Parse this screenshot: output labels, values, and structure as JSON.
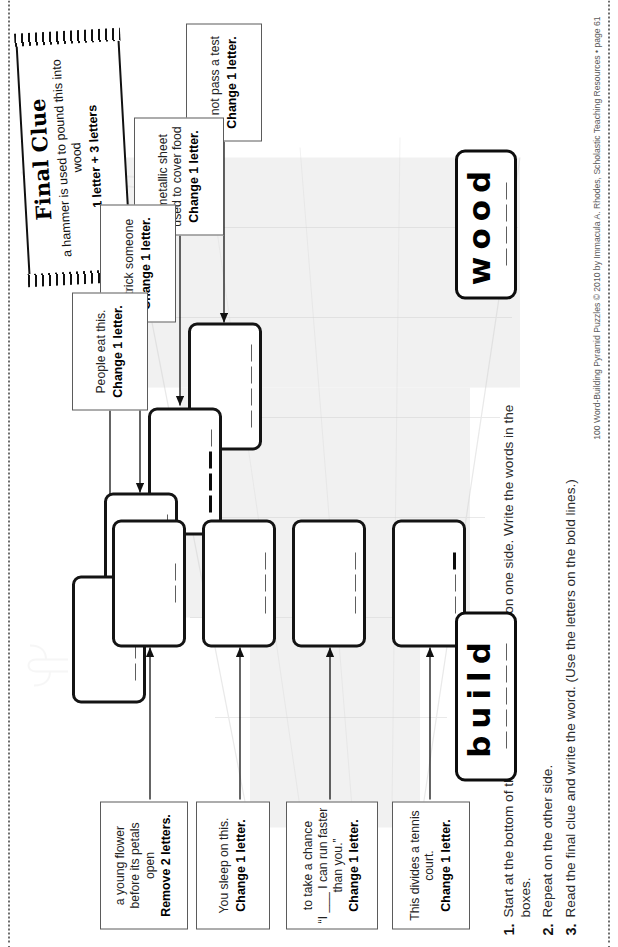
{
  "page": {
    "orientation_note": "worksheet rotated 90 degrees",
    "footer": "100 Word-Building Pyramid Puzzles © 2010 by Immacula A. Rhodes, Scholastic Teaching Resources • page 61"
  },
  "final_clue": {
    "title": "Final Clue",
    "line1": "a hammer is used to pound this into wood",
    "line2": "1 letter + 3 letters"
  },
  "instructions": [
    {
      "num": "1.",
      "text": "Start at the bottom of the pyramid. Read the clues on one side. Write the words in the boxes."
    },
    {
      "num": "2.",
      "text": "Repeat on the other side."
    },
    {
      "num": "3.",
      "text": "Read the final clue and write the word. (Use the letters on the bold lines.)"
    }
  ],
  "clues_top": [
    {
      "text": "to not pass a test",
      "bold": "Change 1 letter."
    },
    {
      "text": "a metallic sheet used to cover food",
      "bold": "Change 1 letter."
    },
    {
      "text": "to trick someone",
      "bold": "Change 1 letter."
    },
    {
      "text": "People eat this.",
      "bold": "Change 1 letter."
    }
  ],
  "clues_bottom": [
    {
      "text": "This divides a tennis court.",
      "bold": "Change 1 letter."
    },
    {
      "text": "to take a chance\n“I ___ I can run faster than you.”",
      "bold": "Change 1 letter."
    },
    {
      "text": "You sleep on this.",
      "bold": "Change 1 letter."
    },
    {
      "text": "a young flower before its petals open",
      "bold": "Remove 2 letters."
    }
  ],
  "word_boxes": [
    {
      "word": "wood",
      "letters": 4,
      "position": "top"
    },
    {
      "word": "build",
      "letters": 5,
      "position": "bottom"
    }
  ],
  "answer_boxes": [
    {
      "id": "a1",
      "lines": [
        {
          "bold": false
        },
        {
          "bold": false
        },
        {
          "bold": false
        },
        {
          "bold": false
        }
      ]
    },
    {
      "id": "a2",
      "lines": [
        {
          "bold": true
        },
        {
          "bold": true
        },
        {
          "bold": true
        },
        {
          "bold": false
        }
      ]
    },
    {
      "id": "a3",
      "lines": [
        {
          "bold": false
        },
        {
          "bold": false
        },
        {
          "bold": false
        },
        {
          "bold": false
        }
      ]
    },
    {
      "id": "a4",
      "lines": [
        {
          "bold": false
        },
        {
          "bold": false
        },
        {
          "bold": false
        },
        {
          "bold": false
        }
      ]
    },
    {
      "id": "a5",
      "lines": [
        {
          "bold": false
        },
        {
          "bold": false
        },
        {
          "bold": true
        }
      ]
    },
    {
      "id": "a6",
      "lines": [
        {
          "bold": false
        },
        {
          "bold": false
        },
        {
          "bold": false
        }
      ]
    },
    {
      "id": "a7",
      "lines": [
        {
          "bold": false
        },
        {
          "bold": false
        },
        {
          "bold": false
        }
      ]
    },
    {
      "id": "a8",
      "lines": [
        {
          "bold": false
        },
        {
          "bold": false
        }
      ]
    }
  ],
  "colors": {
    "ink": "#111111",
    "clue_border": "#5b5b5b",
    "rule": "#5e5e5e",
    "paper": "#ffffff",
    "pyramid_shade": "#e3e3e3"
  }
}
